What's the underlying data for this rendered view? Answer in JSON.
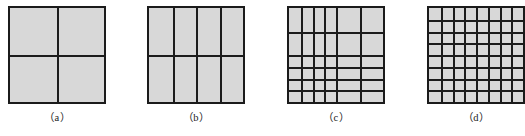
{
  "figure": {
    "background_color": "#ffffff",
    "fill_color": "#d8d8d8",
    "line_color": "#1b1b1b",
    "panel_count": 4
  },
  "panels": [
    {
      "id": "a",
      "label": "（a）",
      "width": 98,
      "height": 98,
      "description": "square subdivided into a 2 by 2 uniform grid",
      "columns": 2,
      "rows": 2,
      "vertical_fractions": [
        0.5
      ],
      "horizontal_fractions": [
        0.5
      ],
      "cell_count": 4
    },
    {
      "id": "b",
      "label": "（b）",
      "width": 98,
      "height": 98,
      "description": "square subdivided into 4 columns by 2 rows",
      "columns": 4,
      "rows": 2,
      "vertical_fractions": [
        0.25,
        0.5,
        0.75
      ],
      "horizontal_fractions": [
        0.5
      ],
      "cell_count": 8
    },
    {
      "id": "c",
      "label": "（c）",
      "width": 98,
      "height": 98,
      "description": "square subdivided into a non-uniform grid, finer near the lower left",
      "columns": 6,
      "rows": 6,
      "vertical_fractions": [
        0.125,
        0.25,
        0.375,
        0.5,
        0.75
      ],
      "horizontal_fractions": [
        0.25,
        0.5,
        0.625,
        0.75,
        0.875
      ],
      "cell_count": 36
    },
    {
      "id": "d",
      "label": "（d）",
      "width": 98,
      "height": 98,
      "description": "square subdivided into an 8 by 8 uniform grid",
      "columns": 8,
      "rows": 8,
      "vertical_fractions": [
        0.125,
        0.25,
        0.375,
        0.5,
        0.625,
        0.75,
        0.875
      ],
      "horizontal_fractions": [
        0.125,
        0.25,
        0.375,
        0.5,
        0.625,
        0.75,
        0.875
      ],
      "cell_count": 64
    }
  ]
}
